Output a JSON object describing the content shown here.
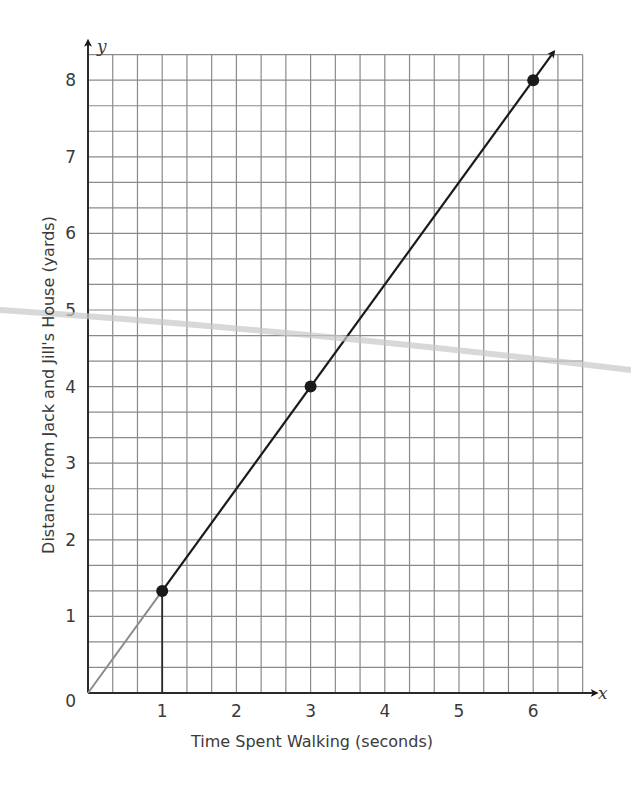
{
  "chart_data": {
    "type": "line",
    "title": "",
    "xlabel": "Time Spent Walking (seconds)",
    "ylabel": "Distance from Jack and Jill's House (yards)",
    "x_axis_var": "x",
    "y_axis_var": "y",
    "xlim": [
      0,
      6.6667
    ],
    "ylim": [
      0,
      8.3333
    ],
    "x_ticks": [
      0,
      1,
      2,
      3,
      4,
      5,
      6
    ],
    "x_tick_labels": [
      "1",
      "2",
      "3",
      "4",
      "5",
      "6"
    ],
    "y_ticks": [
      1,
      2,
      3,
      4,
      5,
      6,
      7,
      8
    ],
    "y_tick_labels": [
      "1",
      "2",
      "3",
      "4",
      "5",
      "6",
      "7",
      "8"
    ],
    "origin_label": "0",
    "grid": true,
    "grid_subdivisions_per_unit": 3,
    "legend": null,
    "series": [
      {
        "name": "Distance vs Time",
        "points": [
          {
            "x": 1,
            "y": 1.333
          },
          {
            "x": 3,
            "y": 4
          },
          {
            "x": 6,
            "y": 8
          }
        ],
        "line_equation": "y = 4/3 x",
        "extension_from_origin": {
          "from": [
            0,
            0
          ],
          "to": [
            1,
            1.333
          ],
          "style": "gray"
        },
        "arrow_end": true,
        "color": "#1a1a1a"
      }
    ],
    "annotations": [
      {
        "type": "vertical-segment",
        "x": 1,
        "from_y": 0,
        "to_y": 1.333
      }
    ]
  },
  "colors": {
    "grid": "#8a8a8a",
    "axis": "#2a2a2a",
    "line": "#1a1a1a",
    "extension": "#8c8c8c",
    "streak": "#c8c8c8"
  }
}
